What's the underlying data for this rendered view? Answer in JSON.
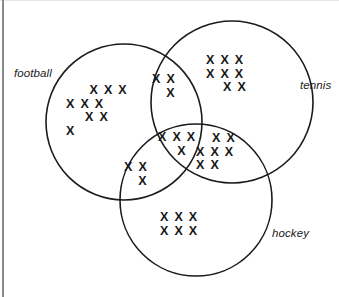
{
  "diagram": {
    "background_color": "#ffffff",
    "stroke_color": "#1b1b1b",
    "mark_color": "#181818",
    "mark_glyph": "X",
    "border_color": "#8a8a8a"
  },
  "sets": [
    {
      "key": "football",
      "label": "football",
      "label_x": 14,
      "label_y": 67,
      "cx": 124,
      "cy": 122,
      "r": 78
    },
    {
      "key": "tennis",
      "label": "tennis",
      "label_x": 300,
      "label_y": 79,
      "cx": 232,
      "cy": 102,
      "r": 81
    },
    {
      "key": "hockey",
      "label": "hockey",
      "label_x": 272,
      "label_y": 227,
      "cx": 196,
      "cy": 200,
      "r": 76
    }
  ],
  "regions": [
    {
      "key": "football_only",
      "description": "football only",
      "count": 9,
      "x": 66,
      "y": 84,
      "width": 62,
      "rows": [
        {
          "text": "X X X",
          "align": "r-right"
        },
        {
          "text": "X X X",
          "align": "r-left"
        },
        {
          "text": "X X",
          "align": "r-center"
        },
        {
          "text": "X",
          "align": "r-left"
        }
      ]
    },
    {
      "key": "tennis_only",
      "description": "tennis only",
      "count": 8,
      "x": 206,
      "y": 54,
      "width": 58,
      "rows": [
        {
          "text": "X X X",
          "align": "r-left"
        },
        {
          "text": "X X X",
          "align": "r-left"
        },
        {
          "text": "X X",
          "align": "r-center"
        }
      ]
    },
    {
      "key": "football_tennis",
      "description": "football and tennis only",
      "count": 3,
      "x": 152,
      "y": 73,
      "width": 38,
      "rows": [
        {
          "text": "X X",
          "align": "r-left"
        },
        {
          "text": "X",
          "align": "r-center"
        }
      ]
    },
    {
      "key": "football_tennis_hockey",
      "description": "football and tennis and hockey",
      "count": 4,
      "x": 158,
      "y": 131,
      "width": 48,
      "rows": [
        {
          "text": "X X X",
          "align": "r-left"
        },
        {
          "text": "X",
          "align": "r-center"
        }
      ]
    },
    {
      "key": "tennis_hockey",
      "description": "tennis and hockey only",
      "count": 7,
      "x": 196,
      "y": 132,
      "width": 56,
      "rows": [
        {
          "text": "X X",
          "align": "r-center"
        },
        {
          "text": "X X X",
          "align": "r-left"
        },
        {
          "text": "X X",
          "align": "r-left"
        }
      ]
    },
    {
      "key": "football_hockey",
      "description": "football and hockey only",
      "count": 3,
      "x": 124,
      "y": 161,
      "width": 38,
      "rows": [
        {
          "text": "X X",
          "align": "r-left"
        },
        {
          "text": "X",
          "align": "r-center"
        }
      ]
    },
    {
      "key": "hockey_only",
      "description": "hockey only",
      "count": 6,
      "x": 160,
      "y": 211,
      "width": 52,
      "rows": [
        {
          "text": "X X X",
          "align": "r-left"
        },
        {
          "text": "X X X",
          "align": "r-left"
        }
      ]
    }
  ]
}
